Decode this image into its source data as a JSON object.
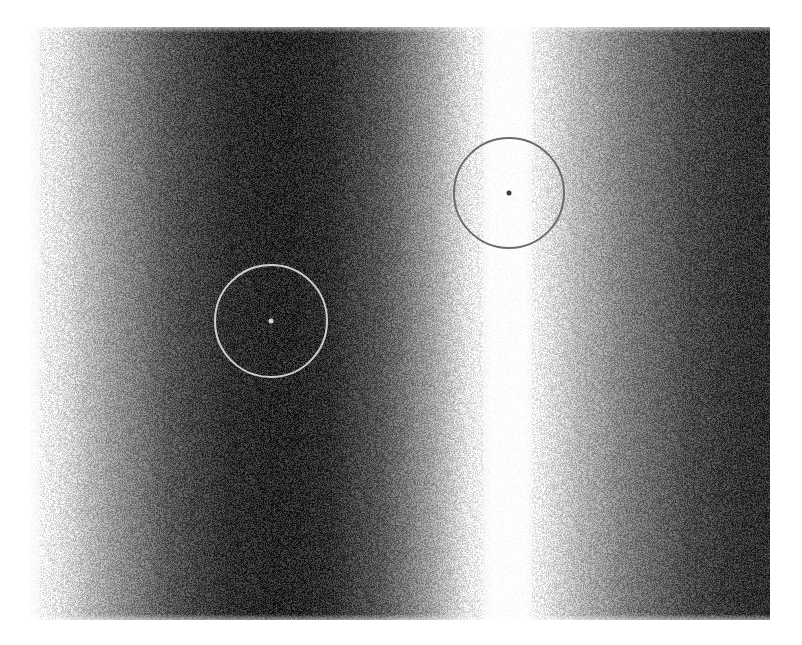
{
  "figure": {
    "kind": "interference-fringe-image",
    "colormap": "grayscale",
    "canvas": {
      "width": 802,
      "height": 645,
      "background": "#ffffff"
    },
    "field": {
      "x": 30,
      "y": 27,
      "width": 740,
      "height": 593
    },
    "fringe_profile": [
      {
        "x": 30,
        "gray": "#ffffff"
      },
      {
        "x": 60,
        "gray": "#e2e2e2"
      },
      {
        "x": 110,
        "gray": "#9a9a9a"
      },
      {
        "x": 170,
        "gray": "#555555"
      },
      {
        "x": 230,
        "gray": "#2e2e2e"
      },
      {
        "x": 280,
        "gray": "#262626"
      },
      {
        "x": 330,
        "gray": "#2e2e2e"
      },
      {
        "x": 385,
        "gray": "#5a5a5a"
      },
      {
        "x": 430,
        "gray": "#9c9c9c"
      },
      {
        "x": 470,
        "gray": "#e8e8e8"
      },
      {
        "x": 492,
        "gray": "#ffffff"
      },
      {
        "x": 525,
        "gray": "#ffffff"
      },
      {
        "x": 545,
        "gray": "#e4e4e4"
      },
      {
        "x": 580,
        "gray": "#b4b4b4"
      },
      {
        "x": 630,
        "gray": "#7a7a7a"
      },
      {
        "x": 690,
        "gray": "#4a4a4a"
      },
      {
        "x": 740,
        "gray": "#333333"
      },
      {
        "x": 770,
        "gray": "#2e2e2e"
      }
    ],
    "noise_opacity": 0.28,
    "markers": [
      {
        "id": "marker-bright-fringe",
        "cx": 509,
        "cy": 193,
        "r": 55,
        "stroke": "#6a6a6a",
        "stroke_width": 2,
        "dot_r": 2.5,
        "dot_fill": "#3a3a3a"
      },
      {
        "id": "marker-dark-fringe",
        "cx": 271,
        "cy": 321,
        "r": 56,
        "stroke": "#cfcfcf",
        "stroke_width": 2,
        "dot_r": 2.5,
        "dot_fill": "#d8d8d8"
      }
    ]
  }
}
